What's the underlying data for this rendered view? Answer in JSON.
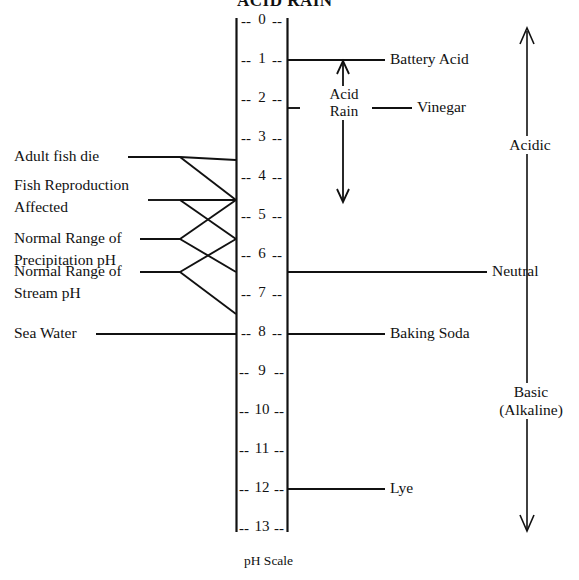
{
  "title": "ACID RAIN",
  "caption": "pH Scale",
  "scale": {
    "name": "pH Scale",
    "min": 0,
    "max": 14,
    "ticks": [
      "0",
      "1",
      "2",
      "3",
      "4",
      "5",
      "6",
      "7",
      "8",
      "9",
      "10",
      "11",
      "12",
      "13",
      "14"
    ],
    "tick_dash_left": "--",
    "tick_dash_right": "--"
  },
  "left_labels": [
    {
      "id": "adult-fish-die",
      "lines": [
        "Adult fish die"
      ],
      "range": [
        4,
        5
      ]
    },
    {
      "id": "fish-reproduction-affected",
      "lines": [
        "Fish Reproduction",
        "Affected"
      ],
      "range": [
        5,
        6
      ]
    },
    {
      "id": "normal-range-precipitation-ph",
      "lines": [
        "Normal Range of",
        "Precipitation pH"
      ],
      "range": [
        5,
        6
      ]
    },
    {
      "id": "normal-range-stream-ph",
      "lines": [
        "Normal Range of",
        "Stream pH"
      ],
      "range": [
        6,
        8
      ]
    },
    {
      "id": "sea-water",
      "lines": [
        "Sea Water"
      ],
      "value": 8.5
    }
  ],
  "right_labels": [
    {
      "id": "battery-acid",
      "text": "Battery Acid",
      "value": 1
    },
    {
      "id": "vinegar",
      "text": "Vinegar",
      "value": 2.25
    },
    {
      "id": "neutral",
      "text": "Neutral",
      "value": 7
    },
    {
      "id": "baking-soda",
      "text": "Baking Soda",
      "value": 8.5
    },
    {
      "id": "lye",
      "text": "Lye",
      "value": 13
    }
  ],
  "acid_rain_marker": {
    "lines": [
      "Acid",
      "Rain"
    ],
    "range_top": 1.1,
    "range_bottom": 5.45,
    "arrow": "double-headed-vertical"
  },
  "zone_arrow": {
    "arrow": "double-headed-vertical",
    "top_value": 0,
    "bottom_value": 14,
    "zones": [
      {
        "id": "acidic",
        "lines": [
          "Acidic"
        ]
      },
      {
        "id": "neutral",
        "lines": [
          "Neutral"
        ]
      },
      {
        "id": "basic",
        "lines": [
          "Basic",
          "(Alkaline)"
        ]
      }
    ]
  },
  "colors": {
    "ink": "#111111",
    "background": "#ffffff"
  }
}
